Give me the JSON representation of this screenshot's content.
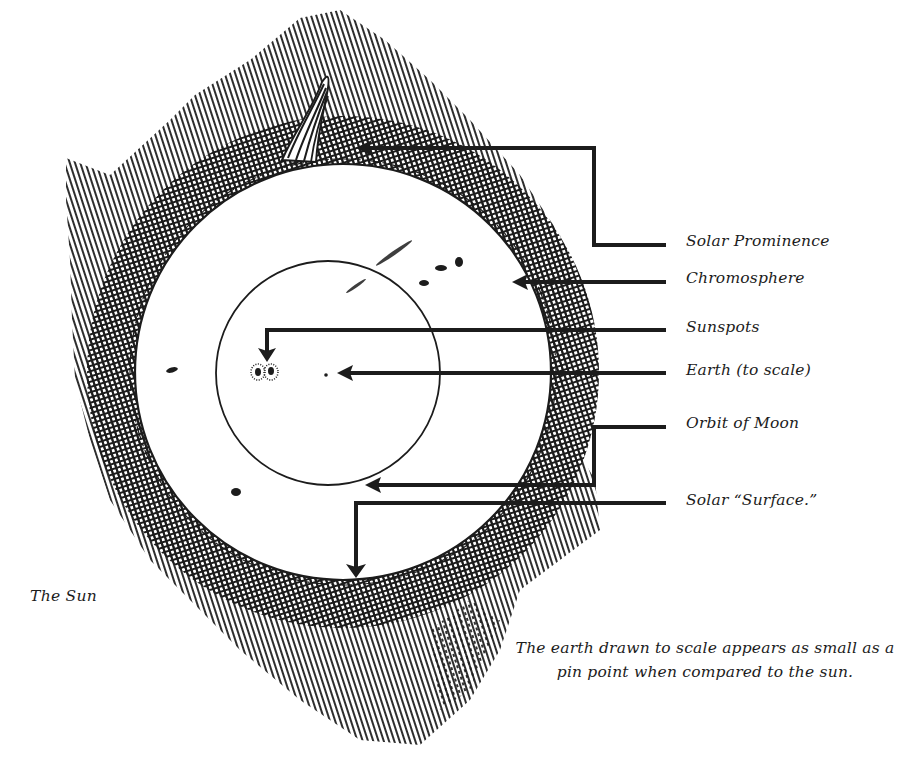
{
  "figure": {
    "title": "The Sun",
    "caption_line1": "The earth drawn to scale appears as small as a",
    "caption_line2": "pin point when compared to the sun.",
    "ink_color": "#1c1c1c",
    "background_color": "#ffffff"
  },
  "labels": [
    {
      "id": "solar-prominence",
      "text": "Solar Prominence"
    },
    {
      "id": "chromosphere",
      "text": "Chromosphere"
    },
    {
      "id": "sunspots",
      "text": "Sunspots"
    },
    {
      "id": "earth",
      "text": "Earth",
      "suffix": "(to scale)"
    },
    {
      "id": "orbit-of-moon",
      "text": "Orbit of Moon"
    },
    {
      "id": "solar-surface",
      "text": "Solar “Surface.”"
    }
  ],
  "geometry": {
    "sun": {
      "cx": 343,
      "cy": 372,
      "r": 208
    },
    "moon_orbit": {
      "cx": 328,
      "cy": 373,
      "r": 112
    },
    "earth_dot": {
      "cx": 326,
      "cy": 375,
      "r": 1.6
    }
  }
}
